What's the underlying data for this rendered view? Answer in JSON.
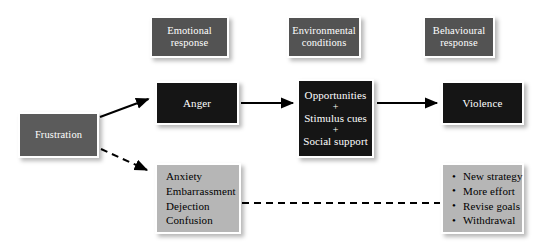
{
  "diagram": {
    "colors": {
      "header_box": "#535353",
      "dark_box": "#151515",
      "mid_gray_box": "#5b5b5b",
      "light_box": "#b6b6b6",
      "box_border": "#ffffff",
      "connector": "#000000",
      "background": "#ffffff"
    },
    "column_headers": [
      {
        "id": "emotional",
        "line1": "Emotional",
        "line2": "response"
      },
      {
        "id": "environmental",
        "line1": "Environmental",
        "line2": "conditions"
      },
      {
        "id": "behavioural",
        "line1": "Behavioural",
        "line2": "response"
      }
    ],
    "nodes": {
      "frustration": {
        "label": "Frustration"
      },
      "anger": {
        "label": "Anger"
      },
      "opportunities": {
        "line1": "Opportunities",
        "plus1": "+",
        "line2": "Stimulus cues",
        "plus2": "+",
        "line3": "Social support"
      },
      "violence": {
        "label": "Violence"
      },
      "negative_emotions": {
        "items": [
          "Anxiety",
          "Embarrassment",
          "Dejection",
          "Confusion"
        ]
      },
      "coping_responses": {
        "items": [
          "New strategy",
          "More effort",
          "Revise goals",
          "Withdrawal"
        ]
      }
    },
    "connectors": [
      {
        "id": "frustration-to-anger",
        "style": "solid",
        "arrow": true
      },
      {
        "id": "frustration-to-negative",
        "style": "dashed",
        "arrow": true
      },
      {
        "id": "anger-to-opportunities",
        "style": "solid",
        "arrow": true
      },
      {
        "id": "opportunities-to-violence",
        "style": "solid",
        "arrow": true
      },
      {
        "id": "negative-to-coping",
        "style": "dashed",
        "arrow": false
      }
    ]
  }
}
